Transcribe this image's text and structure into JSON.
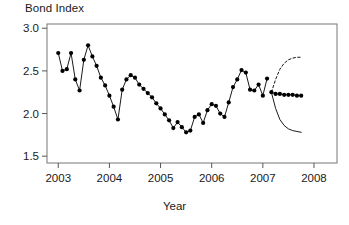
{
  "chart_data": {
    "type": "line",
    "title": "Bond Index",
    "xlabel": "Year",
    "ylabel": "",
    "xlim": [
      2002.78,
      2008.45
    ],
    "ylim": [
      1.42,
      3.05
    ],
    "xticks": [
      2003,
      2004,
      2005,
      2006,
      2007,
      2008
    ],
    "xticklabels": [
      "2003",
      "2004",
      "2005",
      "2006",
      "2007",
      "2008"
    ],
    "yticks": [
      1.5,
      2.0,
      2.5,
      3.0
    ],
    "yticklabels": [
      "1.5",
      "2.0",
      "2.5",
      "3.0"
    ],
    "grid": false,
    "legend": null,
    "series": [
      {
        "name": "Bond index (observed)",
        "style": "line-with-filled-circles",
        "color": "#000000",
        "x": [
          2003.0,
          2003.083,
          2003.167,
          2003.25,
          2003.333,
          2003.417,
          2003.5,
          2003.583,
          2003.667,
          2003.75,
          2003.833,
          2003.917,
          2004.0,
          2004.083,
          2004.167,
          2004.25,
          2004.333,
          2004.417,
          2004.5,
          2004.583,
          2004.667,
          2004.75,
          2004.833,
          2004.917,
          2005.0,
          2005.083,
          2005.167,
          2005.25,
          2005.333,
          2005.417,
          2005.5,
          2005.583,
          2005.667,
          2005.75,
          2005.833,
          2005.917,
          2006.0,
          2006.083,
          2006.167,
          2006.25,
          2006.333,
          2006.417,
          2006.5,
          2006.583,
          2006.667,
          2006.75,
          2006.833,
          2006.917,
          2007.0,
          2007.083
        ],
        "y": [
          2.71,
          2.5,
          2.52,
          2.71,
          2.4,
          2.27,
          2.63,
          2.8,
          2.67,
          2.56,
          2.42,
          2.33,
          2.21,
          2.08,
          1.93,
          2.28,
          2.4,
          2.45,
          2.42,
          2.34,
          2.29,
          2.24,
          2.19,
          2.12,
          2.06,
          1.99,
          1.92,
          1.83,
          1.9,
          1.84,
          1.78,
          1.8,
          1.96,
          1.99,
          1.89,
          2.04,
          2.11,
          2.09,
          2.0,
          1.96,
          2.13,
          2.31,
          2.4,
          2.51,
          2.48,
          2.28,
          2.27,
          2.34,
          2.21,
          2.41
        ]
      },
      {
        "name": "Forecast (point)",
        "style": "line-with-filled-circles",
        "color": "#000000",
        "x": [
          2007.167,
          2007.25,
          2007.333,
          2007.417,
          2007.5,
          2007.583,
          2007.667,
          2007.75
        ],
        "y": [
          2.25,
          2.23,
          2.23,
          2.22,
          2.22,
          2.22,
          2.21,
          2.21
        ]
      },
      {
        "name": "Upper bound",
        "style": "dashed-line",
        "color": "#000000",
        "x": [
          2007.167,
          2007.25,
          2007.333,
          2007.417,
          2007.5,
          2007.583,
          2007.667,
          2007.75
        ],
        "y": [
          2.25,
          2.4,
          2.52,
          2.59,
          2.63,
          2.65,
          2.66,
          2.66
        ]
      },
      {
        "name": "Lower bound",
        "style": "solid-line",
        "color": "#000000",
        "x": [
          2007.167,
          2007.25,
          2007.333,
          2007.417,
          2007.5,
          2007.583,
          2007.667,
          2007.75
        ],
        "y": [
          2.25,
          2.06,
          1.93,
          1.86,
          1.82,
          1.8,
          1.79,
          1.78
        ]
      }
    ]
  }
}
